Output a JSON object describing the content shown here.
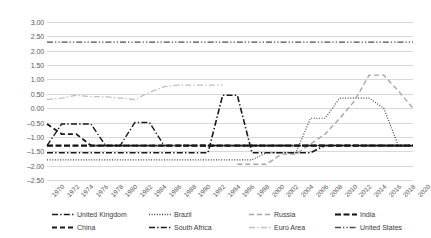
{
  "chart_data": {
    "type": "line",
    "title": "",
    "xlabel": "",
    "ylabel": "",
    "xlim": [
      1970,
      2020
    ],
    "ylim": [
      -2.5,
      3.0
    ],
    "ytick_step": 0.5,
    "grid": true,
    "legend_position": "bottom",
    "x": [
      1970,
      1972,
      1974,
      1976,
      1978,
      1980,
      1982,
      1984,
      1986,
      1988,
      1990,
      1992,
      1994,
      1996,
      1998,
      2000,
      2002,
      2004,
      2006,
      2008,
      2010,
      2012,
      2014,
      2016,
      2018,
      2020
    ],
    "ytick_labels": [
      "3.00",
      "2.50",
      "2.00",
      "1.50",
      "1.00",
      "0.50",
      "0.00",
      "-0.50",
      "-1.00",
      "-1.50",
      "-2.00",
      "-2.50"
    ],
    "xtick_labels": [
      "1970",
      "1972",
      "1974",
      "1976",
      "1978",
      "1980",
      "1982",
      "1984",
      "1986",
      "1988",
      "1990",
      "1992",
      "1994",
      "1996",
      "1998",
      "2000",
      "2002",
      "2004",
      "2006",
      "2008",
      "2010",
      "2012",
      "2014",
      "2016",
      "2018",
      "2020"
    ],
    "series": [
      {
        "name": "United Kingdom",
        "color": "#1a1a1a",
        "dash": "dash-dot",
        "width": 1.4,
        "values": [
          -1.3,
          -0.55,
          -0.55,
          -0.55,
          -1.3,
          -1.3,
          -0.5,
          -0.5,
          -1.3,
          -1.3,
          -1.3,
          -1.3,
          -1.3,
          -1.3,
          -1.3,
          -1.3,
          -1.3,
          -1.3,
          -1.3,
          -1.3,
          -1.3,
          -1.3,
          -1.3,
          -1.3,
          -1.3,
          -1.3
        ]
      },
      {
        "name": "Brazil",
        "color": "#404040",
        "dash": "dotted",
        "width": 1.2,
        "values": [
          -1.8,
          -1.8,
          -1.8,
          -1.8,
          -1.8,
          -1.8,
          -1.8,
          -1.8,
          -1.8,
          -1.8,
          -1.8,
          -1.8,
          -1.8,
          -1.8,
          -1.8,
          -1.55,
          -1.55,
          -1.55,
          -0.35,
          -0.35,
          0.35,
          0.35,
          0.35,
          0.0,
          -1.3,
          -1.3
        ]
      },
      {
        "name": "Russia",
        "color": "#a6a6a6",
        "dash": "dash",
        "width": 1.4,
        "values": [
          null,
          null,
          null,
          null,
          null,
          null,
          null,
          null,
          null,
          null,
          null,
          null,
          null,
          -1.95,
          -1.95,
          -1.95,
          -1.6,
          -1.6,
          -1.25,
          -0.9,
          -0.35,
          0.25,
          1.15,
          1.15,
          0.6,
          0.0
        ]
      },
      {
        "name": "India",
        "color": "#111111",
        "dash": "dash-heavy",
        "width": 2.2,
        "values": [
          -1.3,
          -1.3,
          -1.3,
          -1.3,
          -1.3,
          -1.3,
          -1.3,
          -1.3,
          -1.3,
          -1.3,
          -1.3,
          -1.3,
          -1.3,
          -1.3,
          -1.3,
          -1.3,
          -1.3,
          -1.3,
          -1.3,
          -1.3,
          -1.3,
          -1.3,
          -1.3,
          -1.3,
          -1.3,
          -1.3
        ]
      },
      {
        "name": "China",
        "color": "#1a1a1a",
        "dash": "dash",
        "width": 1.8,
        "values": [
          -0.55,
          -0.9,
          -0.9,
          -1.3,
          -1.3,
          -1.3,
          -1.3,
          -1.3,
          -1.3,
          -1.3,
          -1.3,
          -1.3,
          -1.3,
          -1.3,
          -1.3,
          -1.3,
          -1.3,
          -1.3,
          -1.3,
          -1.3,
          -1.3,
          -1.3,
          -1.3,
          -1.3,
          -1.3,
          -1.3
        ]
      },
      {
        "name": "South Africa",
        "color": "#1a1a1a",
        "dash": "dash-dot",
        "width": 1.6,
        "values": [
          -1.55,
          -1.55,
          -1.55,
          -1.55,
          -1.55,
          -1.55,
          -1.55,
          -1.55,
          -1.55,
          -1.55,
          -1.55,
          -1.55,
          0.45,
          0.45,
          -1.55,
          -1.55,
          -1.55,
          -1.55,
          -1.55,
          -1.3,
          -1.3,
          -1.3,
          -1.3,
          -1.3,
          -1.3,
          -1.3
        ]
      },
      {
        "name": "Euro Area",
        "color": "#bfbfbf",
        "dash": "dash-dot",
        "width": 1.3,
        "values": [
          0.3,
          0.35,
          0.45,
          0.4,
          0.4,
          0.35,
          0.3,
          0.55,
          0.75,
          0.8,
          0.8,
          0.8,
          0.8,
          null,
          null,
          null,
          null,
          null,
          null,
          null,
          null,
          null,
          null,
          null,
          null,
          null
        ]
      },
      {
        "name": "United States",
        "color": "#4d4d4d",
        "dash": "dash-dot-dot",
        "width": 1.4,
        "values": [
          2.3,
          2.3,
          2.3,
          2.3,
          2.3,
          2.3,
          2.3,
          2.3,
          2.3,
          2.3,
          2.3,
          2.3,
          2.3,
          2.3,
          2.3,
          2.3,
          2.3,
          2.3,
          2.3,
          2.3,
          2.3,
          2.3,
          2.3,
          2.3,
          2.3,
          2.3
        ]
      }
    ]
  },
  "legend": {
    "items": [
      {
        "label": "United Kingdom"
      },
      {
        "label": "China"
      },
      {
        "label": "Brazil"
      },
      {
        "label": "South Africa"
      },
      {
        "label": "Russia"
      },
      {
        "label": "Euro Area"
      },
      {
        "label": "India"
      },
      {
        "label": "United States"
      }
    ]
  }
}
